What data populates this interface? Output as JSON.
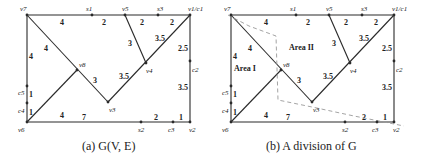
{
  "figure": {
    "panels": [
      {
        "id": "a",
        "caption_prefix": "(a) ",
        "caption_math": "G(V, E)",
        "caption": "(a) G(V, E)"
      },
      {
        "id": "b",
        "caption_prefix": "(b) ",
        "caption": "(b) A division of G",
        "caption_text": "A division of ",
        "caption_math": "G",
        "areas": [
          "Area I",
          "Area II"
        ]
      }
    ],
    "vertices": {
      "v7": "v7",
      "s1": "s1",
      "v5": "v5",
      "s3": "s3",
      "v1c1": "v1/c1",
      "v8": "v8",
      "v4": "v4",
      "c2": "c2",
      "v3": "v3",
      "c5": "c5",
      "c4": "c4",
      "v6": "v6",
      "s2": "s2",
      "c3": "c3",
      "v2": "v2"
    },
    "edge_weights": {
      "v7_s1": "4",
      "s1_v5": "2",
      "v5_s3": "2",
      "s3_v1": "2",
      "v7_c5": "4",
      "v7_v8": "4",
      "v5_v4": "3",
      "v1_v4": "3.5",
      "v1_c2": "2.5",
      "v8_v3": "3",
      "v4_v3": "3.5",
      "c2_v2": "3.5",
      "c5_c4": "1",
      "c4_v6": "1",
      "v6_v8": "4",
      "v6_s2": "7",
      "s2_c3": "2",
      "c3_v2": "1"
    }
  }
}
